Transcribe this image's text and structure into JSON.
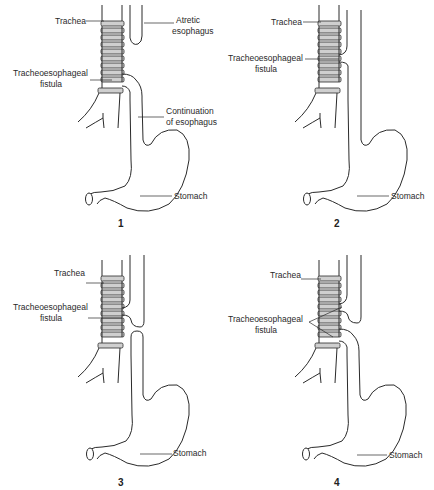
{
  "panels": [
    {
      "number": "1",
      "labels": {
        "trachea": "Trachea",
        "atretic_esophagus_1": "Atretic",
        "atretic_esophagus_2": "esophagus",
        "fistula_1": "Tracheoesophageal",
        "fistula_2": "fistula",
        "continuation_1": "Continuation",
        "continuation_2": "of esophagus",
        "stomach": "Stomach"
      }
    },
    {
      "number": "2",
      "labels": {
        "trachea": "Trachea",
        "fistula_1": "Tracheoesophageal",
        "fistula_2": "fistula",
        "stomach": "Stomach"
      }
    },
    {
      "number": "3",
      "labels": {
        "trachea": "Trachea",
        "fistula_1": "Tracheoesophageal",
        "fistula_2": "fistula",
        "stomach": "Stomach"
      }
    },
    {
      "number": "4",
      "labels": {
        "trachea": "Trachea",
        "fistula_1": "Tracheoesophageal",
        "fistula_2": "fistula",
        "stomach": "Stomach"
      }
    }
  ],
  "colors": {
    "stroke": "#2a2a2a",
    "cartilage": "#cfcfcf"
  }
}
